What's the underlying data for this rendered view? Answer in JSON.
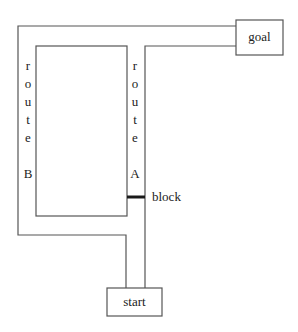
{
  "diagram": {
    "type": "route-maze",
    "nodes": {
      "goal": {
        "label": "goal"
      },
      "start": {
        "label": "start"
      }
    },
    "routes": {
      "route_b": {
        "letters": [
          "r",
          "o",
          "u",
          "t",
          "e"
        ],
        "name": "B"
      },
      "route_a": {
        "letters": [
          "r",
          "o",
          "u",
          "t",
          "e"
        ],
        "name": "A"
      }
    },
    "obstacle": {
      "label": "block"
    },
    "colors": {
      "line": "#555555",
      "block": "#1a1a1a",
      "text": "#222222",
      "background": "#ffffff"
    }
  }
}
